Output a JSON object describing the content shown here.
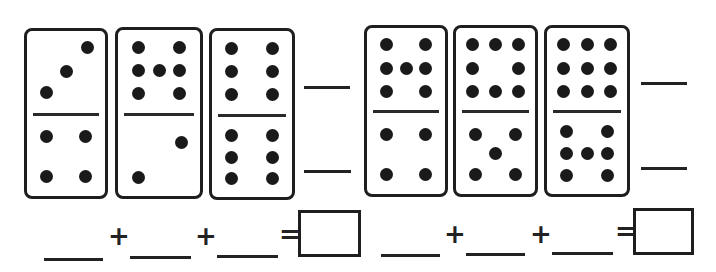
{
  "worksheet": {
    "problems": [
      {
        "dominoes": [
          {
            "top": 3,
            "bottom": 4
          },
          {
            "top": 7,
            "bottom": 2
          },
          {
            "top": 6,
            "bottom": 6
          }
        ],
        "equation": {
          "plus1": "+",
          "plus2": "+",
          "equals": "="
        }
      },
      {
        "dominoes": [
          {
            "top": 7,
            "bottom": 4
          },
          {
            "top": 8,
            "bottom": 5
          },
          {
            "top": 9,
            "bottom": 7
          }
        ],
        "equation": {
          "plus1": "+",
          "plus2": "+",
          "equals": "="
        }
      }
    ]
  },
  "colors": {
    "ink": "#1e1e1e",
    "paper": "#ffffff"
  }
}
